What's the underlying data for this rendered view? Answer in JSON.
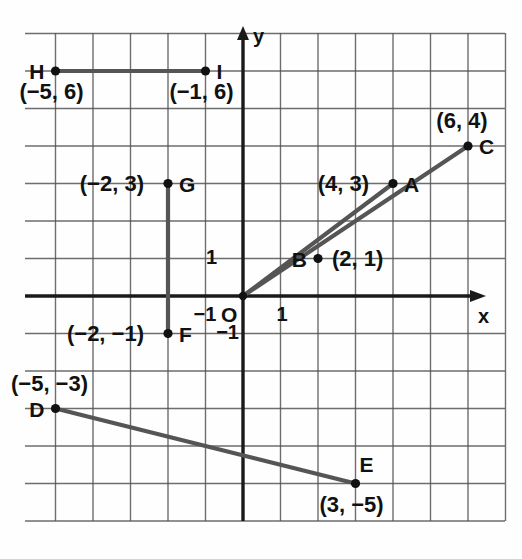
{
  "figure": {
    "kind": "coordinate-plane-graph",
    "axes": {
      "x_label": "x",
      "y_label": "y",
      "origin_label": "O",
      "x_tick_labels": [
        {
          "text": "1",
          "value": 1
        },
        {
          "text": "−1",
          "value": -1
        }
      ],
      "y_tick_labels": [
        {
          "text": "1",
          "value": 1
        },
        {
          "text": "−1",
          "value": -1
        }
      ],
      "x_range": [
        -5.8,
        7.0
      ],
      "y_range": [
        -6.0,
        7.0
      ],
      "grid": true,
      "grid_color": "#4a4a4a",
      "axis_color": "#1a1a1a"
    },
    "colors": {
      "segment": "#555555",
      "point": "#111111",
      "grid": "#555555",
      "text": "#111111"
    }
  },
  "chart_data": {
    "type": "scatter",
    "title": "",
    "xlabel": "x",
    "ylabel": "y",
    "xlim": [
      -5.8,
      7.0
    ],
    "ylim": [
      -6.0,
      7.0
    ],
    "grid": true,
    "points": [
      {
        "name": "A",
        "x": 4,
        "y": 3,
        "coord_text": "(4, 3)",
        "label_side": "right",
        "coord_side": "left"
      },
      {
        "name": "B",
        "x": 2,
        "y": 1,
        "coord_text": "(2, 1)",
        "label_side": "left",
        "coord_side": "right"
      },
      {
        "name": "C",
        "x": 6,
        "y": 4,
        "coord_text": "(6, 4)",
        "label_side": "right",
        "coord_side": "above"
      },
      {
        "name": "D",
        "x": -5,
        "y": -3,
        "coord_text": "(−5, −3)",
        "label_side": "left",
        "coord_side": "above"
      },
      {
        "name": "E",
        "x": 3,
        "y": -5,
        "coord_text": "(3, −5)",
        "label_side": "above",
        "coord_side": "below"
      },
      {
        "name": "F",
        "x": -2,
        "y": -1,
        "coord_text": "(−2, −1)",
        "label_side": "right",
        "coord_side": "left"
      },
      {
        "name": "G",
        "x": -2,
        "y": 3,
        "coord_text": "(−2, 3)",
        "label_side": "right",
        "coord_side": "left"
      },
      {
        "name": "H",
        "x": -5,
        "y": 6,
        "coord_text": "(−5, 6)",
        "label_side": "left",
        "coord_side": "below"
      },
      {
        "name": "I",
        "x": -1,
        "y": 6,
        "coord_text": "(−1, 6)",
        "label_side": "right",
        "coord_side": "below"
      }
    ],
    "segments": [
      {
        "name": "OA",
        "from": [
          0,
          0
        ],
        "to": [
          4,
          3
        ]
      },
      {
        "name": "OC",
        "from": [
          0,
          0
        ],
        "to": [
          6,
          4
        ]
      },
      {
        "name": "FG",
        "from": [
          -2,
          -1
        ],
        "to": [
          -2,
          3
        ]
      },
      {
        "name": "HI",
        "from": [
          -5,
          6
        ],
        "to": [
          -1,
          6
        ]
      },
      {
        "name": "DE",
        "from": [
          -5,
          -3
        ],
        "to": [
          3,
          -5
        ]
      }
    ]
  }
}
